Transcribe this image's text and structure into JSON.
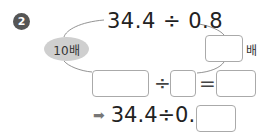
{
  "problem": {
    "number": "2",
    "expression": "34.4 ÷ 0.8",
    "left_multiplier": "10배",
    "right_unit": "배",
    "divide_sign": "÷",
    "equals_sign": "=",
    "final_arrow": "➡",
    "final_expression": "34.4÷0.8="
  },
  "answer_boxes": {
    "right_multiplier": "",
    "dividend": "",
    "divisor": "",
    "quotient": "",
    "final_answer": ""
  }
}
